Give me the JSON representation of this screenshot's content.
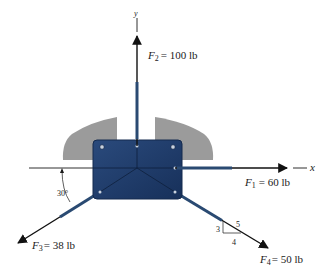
{
  "figure": {
    "type": "free-body force diagram",
    "axes": {
      "x_label": "x",
      "y_label": "y"
    },
    "forces": [
      {
        "id": "F1",
        "symbol": "F",
        "subscript": "1",
        "value_text": "= 60 lb",
        "magnitude": 60,
        "unit": "lb",
        "direction": "along +x axis"
      },
      {
        "id": "F2",
        "symbol": "F",
        "subscript": "2",
        "value_text": "= 100 lb",
        "magnitude": 100,
        "unit": "lb",
        "direction": "along +y axis"
      },
      {
        "id": "F3",
        "symbol": "F",
        "subscript": "3",
        "value_text": "= 38 lb",
        "magnitude": 38,
        "unit": "lb",
        "direction": "30° below -x axis"
      },
      {
        "id": "F4",
        "symbol": "F",
        "subscript": "4",
        "value_text": "= 50 lb",
        "magnitude": 50,
        "unit": "lb",
        "direction": "slope 3-4-5 down-right"
      }
    ],
    "angle_label": "30°",
    "slope_triangle": {
      "rise": "3",
      "run": "4",
      "hyp": "5"
    },
    "colors": {
      "plate": "#1e3a68",
      "plate_edge": "#142a4e",
      "support": "#9a9a9a",
      "line": "#1a1a1a",
      "cable": "#2a4a72",
      "background": "#ffffff"
    }
  }
}
